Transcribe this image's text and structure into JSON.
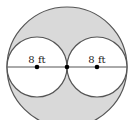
{
  "diagram": {
    "colors": {
      "shade": "#d9d9d9",
      "stroke": "#555555",
      "inner": "#ffffff",
      "dot": "#000000"
    },
    "labels": {
      "left_radius": "8 ft",
      "right_radius": "8 ft"
    },
    "shapes": {
      "outer_circle": {
        "cx": 67,
        "cy": 67,
        "r": 60
      },
      "left_circle": {
        "cx": 37,
        "cy": 67,
        "r": 30
      },
      "right_circle": {
        "cx": 97,
        "cy": 67,
        "r": 30
      },
      "points": [
        "left-center",
        "tangent-point",
        "right-center"
      ]
    }
  }
}
